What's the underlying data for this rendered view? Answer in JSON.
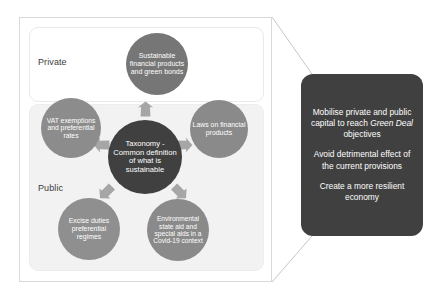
{
  "diagram": {
    "sectors": [
      {
        "id": "private",
        "label": "Private"
      },
      {
        "id": "public",
        "label": "Public"
      }
    ],
    "center_node": {
      "label": "Taxonomy - Common definition of what is sustainable",
      "color": "#404040"
    },
    "nodes": [
      {
        "id": "sustainable-finance",
        "label": "Sustainable financial products and green bonds",
        "sector": "private",
        "color": "#767676"
      },
      {
        "id": "vat-exemptions",
        "label": "VAT exemptions and preferential rates",
        "sector": "public",
        "color": "#8c8c8c"
      },
      {
        "id": "laws-financial-products",
        "label": "Laws on financial products",
        "sector": "public",
        "color": "#8a8a8a"
      },
      {
        "id": "excise-duties",
        "label": "Excise duties preferential regimes",
        "sector": "public",
        "color": "#8f8f8f"
      },
      {
        "id": "state-aid",
        "label": "Environmental state aid and special aids in a Covid-19 context",
        "sector": "public",
        "color": "#8a8a8a"
      }
    ],
    "arrow_color": "#a6a6a6"
  },
  "callout": {
    "background": "#404040",
    "items": [
      {
        "id": "mobilise-capital",
        "pre": "Mobilise private and public capital to reach ",
        "emphasis": "Green Deal",
        "post": " objectives"
      },
      {
        "id": "avoid-detrimental",
        "pre": "Avoid detrimental effect of the current provisions",
        "emphasis": "",
        "post": ""
      },
      {
        "id": "resilient-economy",
        "pre": "Create a more resilient economy",
        "emphasis": "",
        "post": ""
      }
    ]
  }
}
